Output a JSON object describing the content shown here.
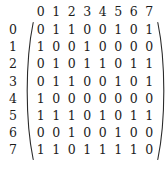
{
  "figure": {
    "kind": "binary-matrix",
    "rows": 8,
    "cols": 8,
    "text_color": "#1c1c1c",
    "background_color": "#ffffff",
    "bracket_style": "parenthesis"
  },
  "matrix": {
    "column_headers": [
      "0",
      "1",
      "2",
      "3",
      "4",
      "5",
      "6",
      "7"
    ],
    "row_headers": [
      "0",
      "1",
      "2",
      "3",
      "4",
      "5",
      "6",
      "7"
    ],
    "rows": [
      [
        "0",
        "1",
        "1",
        "0",
        "0",
        "1",
        "0",
        "1"
      ],
      [
        "1",
        "0",
        "0",
        "1",
        "0",
        "0",
        "0",
        "0"
      ],
      [
        "0",
        "1",
        "0",
        "1",
        "1",
        "0",
        "1",
        "1"
      ],
      [
        "0",
        "1",
        "1",
        "0",
        "0",
        "1",
        "0",
        "1"
      ],
      [
        "1",
        "0",
        "0",
        "0",
        "0",
        "0",
        "0",
        "0"
      ],
      [
        "1",
        "1",
        "1",
        "0",
        "1",
        "0",
        "1",
        "1"
      ],
      [
        "0",
        "0",
        "1",
        "0",
        "0",
        "1",
        "0",
        "0"
      ],
      [
        "1",
        "1",
        "0",
        "1",
        "1",
        "1",
        "1",
        "0"
      ]
    ]
  }
}
